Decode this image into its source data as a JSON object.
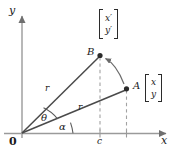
{
  "figure": {
    "type": "geometry-diagram",
    "axes": {
      "x_label": "x",
      "y_label": "y",
      "origin_label": "0",
      "x_tick_label": "c"
    },
    "points": [
      {
        "id": "A",
        "label": "A",
        "vector_top": "x",
        "vector_bottom": "y"
      },
      {
        "id": "B",
        "label": "B",
        "vector_top": "x′",
        "vector_bottom": "y′"
      }
    ],
    "segments": [
      {
        "id": "OB",
        "label": "r"
      },
      {
        "id": "OA",
        "label": "r"
      }
    ],
    "angles": [
      {
        "id": "theta",
        "label": "θ"
      },
      {
        "id": "alpha",
        "label": "α"
      }
    ],
    "colors": {
      "stroke": "#3a3a3a",
      "axis": "#8a8a8a",
      "dashed": "#9a9a9a",
      "point": "#2b2b2b",
      "text": "#1a1a1a",
      "background": "#ffffff"
    }
  }
}
